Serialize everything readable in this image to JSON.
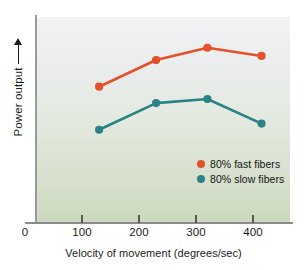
{
  "chart_data": {
    "type": "line",
    "title": "",
    "xlabel": "Velocity of movement (degrees/sec)",
    "ylabel": "Power output",
    "ylabel_arrow": "increasing-arrow",
    "xlim": [
      0,
      470
    ],
    "ylim": [
      0,
      100
    ],
    "xticks": [
      0,
      100,
      200,
      300,
      400
    ],
    "xticklabels": [
      "0",
      "100",
      "200",
      "300",
      "400"
    ],
    "yticks": [],
    "yticklabels": [],
    "grid": false,
    "legend_position": "lower-right",
    "x": [
      130,
      230,
      320,
      415
    ],
    "series": [
      {
        "name": "80% fast fibers",
        "color": "#e4502a",
        "values": [
          66,
          79,
          85,
          81
        ]
      },
      {
        "name": "80% slow fibers",
        "color": "#2a8285",
        "values": [
          45,
          58,
          60,
          48
        ]
      }
    ]
  },
  "figure": {
    "x_axis_title": "Velocity of movement (degrees/sec)",
    "y_axis_title": "Power output",
    "tick_labels": [
      "0",
      "100",
      "200",
      "300",
      "400"
    ],
    "legend": [
      {
        "label": "80% fast fibers",
        "color": "#e4502a"
      },
      {
        "label": "80% slow fibers",
        "color": "#2a8285"
      }
    ],
    "colors": {
      "fast_fibers": "#e4502a",
      "slow_fibers": "#2a8285",
      "plot_background_top": "#f2f2f5",
      "plot_background_bottom": "#ccd9be",
      "axis": "#8c8c8c",
      "text": "#1b1b1b"
    }
  }
}
